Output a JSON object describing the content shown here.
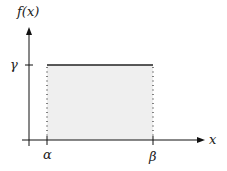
{
  "diagram": {
    "y_axis_label": "f(x)",
    "x_axis_label": "x",
    "level_label": "γ",
    "left_bound_label": "α",
    "right_bound_label": "β",
    "colors": {
      "axis": "#111111",
      "fill": "#efefef",
      "top_line": "#222222",
      "dotted": "#333333"
    }
  }
}
